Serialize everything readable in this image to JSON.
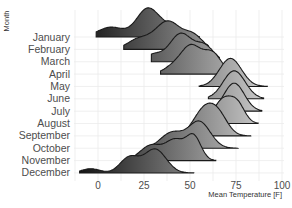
{
  "chart_data": {
    "type": "ridgeline",
    "title": "",
    "xlabel": "Mean Temperature [F]",
    "ylabel": "Month",
    "xlim": [
      -14,
      104
    ],
    "x_ticks": [
      0,
      25,
      50,
      75,
      100
    ],
    "categories": [
      "January",
      "February",
      "March",
      "April",
      "May",
      "June",
      "July",
      "August",
      "September",
      "October",
      "November",
      "December"
    ],
    "fill_gradient": {
      "low": "#1a1a1a",
      "high": "#d9d9d9"
    },
    "series": [
      {
        "name": "January",
        "peaks": [
          {
            "x": 7,
            "h": 0.35,
            "w": 7
          },
          {
            "x": 27,
            "h": 1.0,
            "w": 6
          },
          {
            "x": 40,
            "h": 0.35,
            "w": 6
          }
        ],
        "range": [
          -1,
          55
        ]
      },
      {
        "name": "February",
        "peaks": [
          {
            "x": 22,
            "h": 0.35,
            "w": 6
          },
          {
            "x": 38,
            "h": 1.0,
            "w": 7
          },
          {
            "x": 52,
            "h": 0.45,
            "w": 5
          }
        ],
        "range": [
          14,
          60
        ]
      },
      {
        "name": "March",
        "peaks": [
          {
            "x": 30,
            "h": 0.25,
            "w": 5
          },
          {
            "x": 45,
            "h": 1.0,
            "w": 6
          },
          {
            "x": 58,
            "h": 0.55,
            "w": 5
          }
        ],
        "range": [
          29,
          66
        ]
      },
      {
        "name": "April",
        "peaks": [
          {
            "x": 43,
            "h": 0.35,
            "w": 6
          },
          {
            "x": 51,
            "h": 0.85,
            "w": 5
          },
          {
            "x": 62,
            "h": 0.75,
            "w": 5
          }
        ],
        "range": [
          34,
          72
        ]
      },
      {
        "name": "May",
        "peaks": [
          {
            "x": 72,
            "h": 1.0,
            "w": 6
          }
        ],
        "range": [
          55,
          92
        ]
      },
      {
        "name": "June",
        "peaks": [
          {
            "x": 74,
            "h": 1.0,
            "w": 6
          }
        ],
        "range": [
          60,
          90
        ]
      },
      {
        "name": "July",
        "peaks": [
          {
            "x": 74,
            "h": 1.0,
            "w": 5.5
          }
        ],
        "range": [
          62,
          89
        ]
      },
      {
        "name": "August",
        "peaks": [
          {
            "x": 68,
            "h": 0.85,
            "w": 5
          },
          {
            "x": 76,
            "h": 0.6,
            "w": 4
          }
        ],
        "range": [
          52,
          87
        ]
      },
      {
        "name": "September",
        "peaks": [
          {
            "x": 58,
            "h": 0.95,
            "w": 6
          },
          {
            "x": 66,
            "h": 0.55,
            "w": 5
          }
        ],
        "range": [
          42,
          83
        ]
      },
      {
        "name": "October",
        "peaks": [
          {
            "x": 40,
            "h": 0.55,
            "w": 6
          },
          {
            "x": 55,
            "h": 0.95,
            "w": 6
          }
        ],
        "range": [
          28,
          76
        ]
      },
      {
        "name": "November",
        "peaks": [
          {
            "x": 29,
            "h": 0.55,
            "w": 6
          },
          {
            "x": 42,
            "h": 0.7,
            "w": 5
          },
          {
            "x": 52,
            "h": 0.85,
            "w": 4
          }
        ],
        "range": [
          17,
          64
        ]
      },
      {
        "name": "December",
        "peaks": [
          {
            "x": -4,
            "h": 0.15,
            "w": 5
          },
          {
            "x": 17,
            "h": 0.55,
            "w": 5
          },
          {
            "x": 31,
            "h": 0.85,
            "w": 6
          }
        ],
        "range": [
          -10,
          52
        ]
      }
    ]
  }
}
